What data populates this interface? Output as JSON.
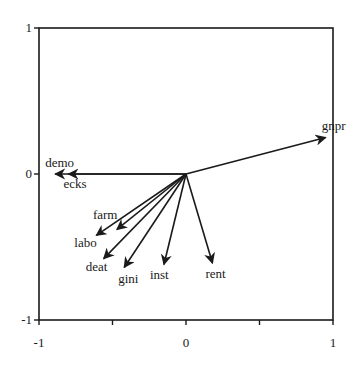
{
  "chart_data": {
    "type": "biplot",
    "title": "",
    "xlabel": "",
    "ylabel": "",
    "xlim": [
      -1,
      1
    ],
    "ylim": [
      -1,
      1
    ],
    "grid": false,
    "legend": null,
    "x_ticks": [
      -1,
      -0.5,
      0,
      0.5,
      1
    ],
    "x_tick_labels": [
      "-1",
      "",
      "0",
      "",
      "1"
    ],
    "y_ticks": [
      -1,
      0,
      1
    ],
    "y_tick_labels": [
      "-1",
      "0",
      "1"
    ],
    "vectors": [
      {
        "name": "gnpr",
        "x": 0.95,
        "y": 0.25,
        "label_dx": -4,
        "label_dy": -8,
        "anchor": "start"
      },
      {
        "name": "demo",
        "x": -0.89,
        "y": 0.0,
        "label_dx": -10,
        "label_dy": -7,
        "anchor": "start"
      },
      {
        "name": "ecks",
        "x": -0.8,
        "y": 0.0,
        "label_dx": -5,
        "label_dy": 14,
        "anchor": "start"
      },
      {
        "name": "farm",
        "x": -0.47,
        "y": -0.38,
        "label_dx": -24,
        "label_dy": -10,
        "anchor": "start"
      },
      {
        "name": "labo",
        "x": -0.61,
        "y": -0.42,
        "label_dx": -22,
        "label_dy": 12,
        "anchor": "start"
      },
      {
        "name": "deat",
        "x": -0.56,
        "y": -0.58,
        "label_dx": -18,
        "label_dy": 12,
        "anchor": "start"
      },
      {
        "name": "gini",
        "x": -0.42,
        "y": -0.64,
        "label_dx": -6,
        "label_dy": 16,
        "anchor": "start"
      },
      {
        "name": "inst",
        "x": -0.15,
        "y": -0.62,
        "label_dx": -14,
        "label_dy": 14,
        "anchor": "start"
      },
      {
        "name": "rent",
        "x": 0.18,
        "y": -0.61,
        "label_dx": -7,
        "label_dy": 15,
        "anchor": "start"
      }
    ]
  },
  "colors": {
    "axis": "#1a1a1a",
    "vector": "#1a1a1a",
    "background": "#ffffff"
  }
}
